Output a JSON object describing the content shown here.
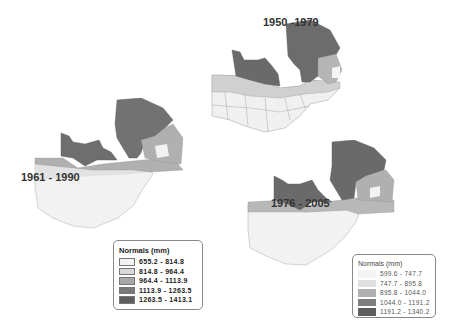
{
  "maps": [
    {
      "id": "map-1950-1979",
      "period": "1950 -1979",
      "legend": null
    },
    {
      "id": "map-1961-1990",
      "period": "1961 - 1990",
      "legend": {
        "title": "Normals (mm)",
        "classes": [
          {
            "range": "655.2 - 814.8",
            "color": "#f2f2f2"
          },
          {
            "range": "814.8 - 964.4",
            "color": "#d9d9d9"
          },
          {
            "range": "964.4 - 1113.9",
            "color": "#a8a8a8"
          },
          {
            "range": "1113.9 - 1263.5",
            "color": "#7a7a7a"
          },
          {
            "range": "1263.5 - 1413.1",
            "color": "#5e5e5e"
          }
        ]
      }
    },
    {
      "id": "map-1976-2005",
      "period": "1976 - 2005",
      "legend": {
        "title": "Normals (mm)",
        "classes": [
          {
            "range": "599.6 - 747.7",
            "color": "#f4f4f4"
          },
          {
            "range": "747.7 - 895.8",
            "color": "#e0e0e0"
          },
          {
            "range": "895.8 - 1044.0",
            "color": "#b0b0b0"
          },
          {
            "range": "1044.0 - 1191.2",
            "color": "#7e7e7e"
          },
          {
            "range": "1191.2 - 1340.2",
            "color": "#5f5f5f"
          }
        ]
      }
    }
  ]
}
